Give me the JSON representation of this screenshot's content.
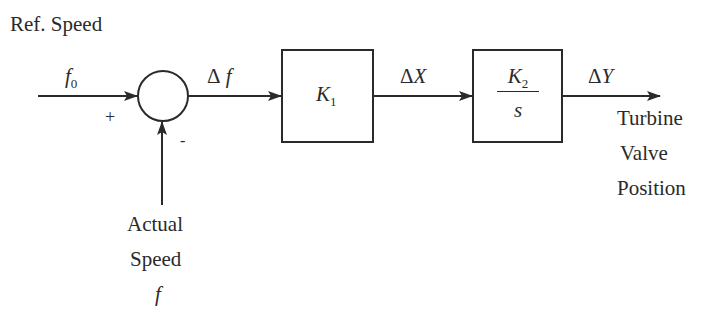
{
  "diagram": {
    "ref_speed_label": "Ref. Speed",
    "input_signal": {
      "symbol": "f",
      "subscript": "0"
    },
    "summing_junction": {
      "plus_sign": "+",
      "minus_sign": "-"
    },
    "error_signal": {
      "delta": "Δ",
      "symbol": "f"
    },
    "block1": {
      "symbol": "K",
      "subscript": "1"
    },
    "intermediate_signal": {
      "delta": "Δ",
      "symbol": "X"
    },
    "block2": {
      "numerator_symbol": "K",
      "numerator_subscript": "2",
      "denominator": "s"
    },
    "output_signal": {
      "delta": "Δ",
      "symbol": "Y"
    },
    "output_label": [
      "Turbine",
      "Valve",
      "Position"
    ],
    "feedback_label": [
      "Actual",
      "Speed"
    ],
    "feedback_signal": "f"
  },
  "colors": {
    "ink": "#2a2a2a",
    "background": "#ffffff"
  }
}
